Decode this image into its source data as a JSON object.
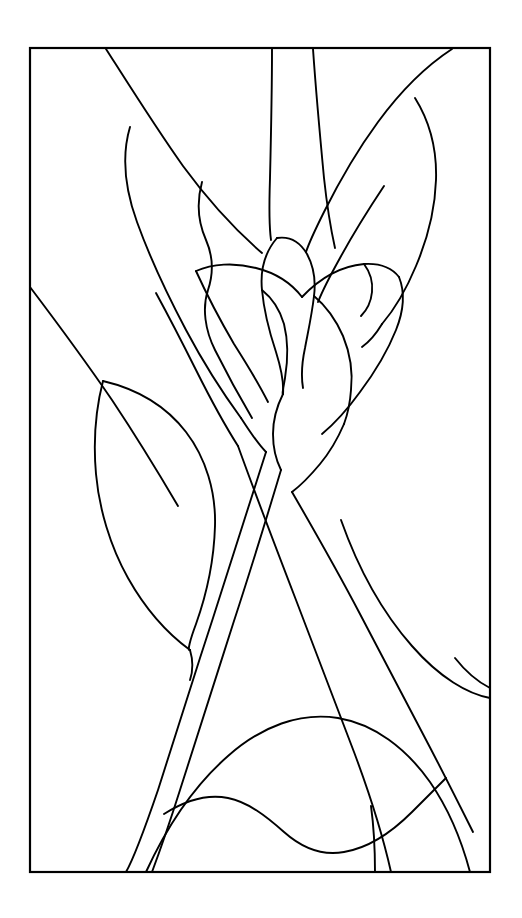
{
  "artwork": {
    "title": "Stained Glass Flower Pattern",
    "subject": "calla-lily-with-leaves",
    "style": "line-art-outline",
    "background_color": "#ffffff",
    "line_color": "#000000",
    "canvas": {
      "width": 522,
      "height": 918
    },
    "frame": {
      "name": "rectangular-border",
      "x": 30,
      "y": 48,
      "width": 460,
      "height": 824,
      "stroke_width": 2.2
    },
    "stroke_width": 1.9,
    "segments": [
      {
        "name": "left-outer-leaf-upper-edge",
        "d": "M 106,49 C 136,96 158,131 183,166 C 205,196 233,228 262,253"
      },
      {
        "name": "left-leaf-outer-contour",
        "d": "M 130,127 C 122,154 124,186 137,222 C 150,258 168,296 186,330 C 203,362 222,392 241,418"
      },
      {
        "name": "left-leaf-inner-vein",
        "d": "M 202,182 C 196,204 198,222 206,240 C 213,256 214,272 208,290 C 202,308 205,330 215,350 C 226,372 239,396 252,418"
      },
      {
        "name": "left-leaf-lower-tip",
        "d": "M 241,418 C 250,432 258,444 266,452"
      },
      {
        "name": "outer-left-sweep",
        "d": "M 30,287 C 58,324 86,362 112,400 C 136,436 158,472 178,506"
      },
      {
        "name": "left-lower-leaf-outer",
        "d": "M 103,381 C 96,408 93,440 96,474 C 99,508 110,546 128,578 C 146,610 168,634 190,650"
      },
      {
        "name": "left-lower-leaf-inner",
        "d": "M 103,381 C 137,389 166,406 186,432 C 206,458 216,492 215,526 C 214,560 206,596 196,624 C 190,640 187,652 190,650"
      },
      {
        "name": "left-lower-leaf-tip",
        "d": "M 190,650 C 193,660 193,671 190,680"
      },
      {
        "name": "flower-left-petal-arc",
        "d": "M 196,271 C 212,264 234,262 256,268 C 276,273 292,284 302,297"
      },
      {
        "name": "flower-left-petal-lower",
        "d": "M 196,271 C 206,293 220,320 234,344 C 248,366 260,386 268,402"
      },
      {
        "name": "flower-left-inner-edge",
        "d": "M 156,293 C 168,315 182,342 196,370 C 210,398 224,424 238,446"
      },
      {
        "name": "flower-center-bud-left",
        "d": "M 277,238 C 265,252 260,270 262,290 C 264,312 270,334 276,352 C 281,368 284,382 283,394"
      },
      {
        "name": "flower-center-bud-right",
        "d": "M 277,238 C 290,236 300,242 307,254 C 313,265 316,280 314,296 C 312,314 308,332 305,348 C 302,362 301,376 303,388"
      },
      {
        "name": "flower-center-bud-tail",
        "d": "M 283,394 C 277,406 273,420 273,434 C 273,448 276,460 281,470"
      },
      {
        "name": "flower-center-seam",
        "d": "M 262,290 C 272,298 280,310 284,324 C 288,340 288,360 285,378 C 283,390 282,394 283,394"
      },
      {
        "name": "flower-right-petal-arc",
        "d": "M 302,297 C 320,278 342,266 364,264 C 380,263 392,268 399,277"
      },
      {
        "name": "flower-right-petal-inner",
        "d": "M 314,296 C 326,306 336,320 343,336 C 350,353 353,372 351,390 C 350,404 347,416 344,424"
      },
      {
        "name": "flower-right-petal-outer",
        "d": "M 399,277 C 405,292 404,310 396,330 C 388,350 375,372 360,392 C 347,410 334,424 322,434"
      },
      {
        "name": "right-petal-lower-lobe",
        "d": "M 344,424 C 338,438 330,452 320,464 C 310,476 300,486 292,492"
      },
      {
        "name": "petal-notch-right",
        "d": "M 364,264 C 370,272 373,282 372,292 C 371,302 367,310 361,316"
      },
      {
        "name": "stem-upper-left-line",
        "d": "M 272,49 C 272,92 271,136 270,178 C 269,208 269,226 271,240"
      },
      {
        "name": "stem-upper-right-line",
        "d": "M 313,49 C 316,92 320,136 324,178 C 327,206 331,230 335,248"
      },
      {
        "name": "upper-right-leaf-outer",
        "d": "M 452,49 C 426,66 400,92 378,122 C 356,152 338,184 324,212 C 314,232 308,246 306,252"
      },
      {
        "name": "upper-right-leaf-curve",
        "d": "M 415,98 C 430,122 437,150 436,180 C 435,210 427,240 416,266 C 406,290 394,310 382,324"
      },
      {
        "name": "upper-right-leaf-inner",
        "d": "M 382,324 C 376,334 369,342 362,347"
      },
      {
        "name": "upper-right-leaf-vein",
        "d": "M 384,186 C 368,210 352,236 340,258 C 330,276 322,292 318,302"
      },
      {
        "name": "stem-main-left",
        "d": "M 266,452 C 249,506 231,562 213,618 C 194,676 175,736 158,790 C 145,828 134,858 126,872"
      },
      {
        "name": "stem-main-right",
        "d": "M 281,470 C 266,520 250,572 233,624 C 215,680 197,738 180,790 C 168,828 158,856 152,872"
      },
      {
        "name": "stem-cross-right",
        "d": "M 238,446 C 256,496 276,548 296,600 C 316,652 336,704 354,752 C 369,792 382,832 391,872"
      },
      {
        "name": "stem-cross-far-right",
        "d": "M 292,492 C 314,530 338,572 360,614 C 382,656 404,698 424,736 C 443,772 460,806 473,832"
      },
      {
        "name": "mid-right-sweep",
        "d": "M 341,520 C 358,568 382,612 412,646 C 440,678 468,694 490,698"
      },
      {
        "name": "bottom-large-arc",
        "d": "M 146,872 C 168,824 196,784 228,756 C 262,726 300,712 338,718 C 374,724 406,748 430,782 C 448,808 462,842 470,872"
      },
      {
        "name": "bottom-wave-line",
        "d": "M 164,814 C 186,800 208,794 228,798 C 248,802 266,816 284,832 C 302,848 322,856 344,852 C 368,848 392,832 412,812 C 428,796 440,784 446,778"
      },
      {
        "name": "bottom-right-vertical",
        "d": "M 371,806 C 374,828 375,850 375,872"
      },
      {
        "name": "upper-right-corner-arc",
        "d": "M 490,688 C 478,682 466,672 455,658"
      }
    ]
  }
}
